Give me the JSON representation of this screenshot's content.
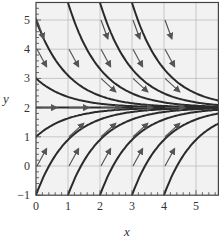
{
  "chart_data": {
    "type": "line",
    "title": "",
    "subtitle": "Slope field with solution curves converging to y = 2",
    "xlabel": "x",
    "ylabel": "y",
    "xlim": [
      0,
      5.7
    ],
    "ylim": [
      -1,
      5.6
    ],
    "x_ticks": [
      "0",
      "1",
      "2",
      "3",
      "4",
      "5"
    ],
    "y_ticks": [
      "-1",
      "0",
      "1",
      "2",
      "3",
      "4",
      "5"
    ],
    "grid": true,
    "legend": "none",
    "equilibrium": 2,
    "series": [
      {
        "name": "curve from (0,5)",
        "x0": 0,
        "y0": 5
      },
      {
        "name": "curve from (0,3)",
        "x0": 0,
        "y0": 3
      },
      {
        "name": "curve from (0,1)",
        "x0": 0,
        "y0": 1
      },
      {
        "name": "curve from (0,-1)",
        "x0": 0,
        "y0": -1
      },
      {
        "name": "curve from (1,-1)",
        "x0": 1,
        "y0": -1
      },
      {
        "name": "curve from (2,-1)",
        "x0": 2,
        "y0": -1
      },
      {
        "name": "curve from (3,-1)",
        "x0": 3,
        "y0": -1
      },
      {
        "name": "curve from (4,-1)",
        "x0": 4,
        "y0": -1
      },
      {
        "name": "curve from (1,5.6)",
        "x0": 1,
        "y0": 5.6
      },
      {
        "name": "curve from (2,5.6)",
        "x0": 2,
        "y0": 5.6
      },
      {
        "name": "curve from (3,5.6)",
        "x0": 3,
        "y0": 5.6
      },
      {
        "name": "curve y=2",
        "x0": 0,
        "y0": 2
      }
    ],
    "arrow_points": [
      [
        0,
        5
      ],
      [
        0,
        4
      ],
      [
        0,
        2
      ],
      [
        0,
        0
      ],
      [
        1,
        4
      ],
      [
        1,
        2
      ],
      [
        1,
        1
      ],
      [
        1,
        0
      ],
      [
        2,
        5
      ],
      [
        2,
        4
      ],
      [
        2,
        3
      ],
      [
        2,
        2
      ],
      [
        2,
        1
      ],
      [
        2,
        0
      ],
      [
        3,
        5
      ],
      [
        3,
        4
      ],
      [
        3,
        3
      ],
      [
        3,
        2
      ],
      [
        3,
        1
      ],
      [
        3,
        0
      ],
      [
        4,
        5
      ],
      [
        4,
        4
      ],
      [
        4,
        3
      ],
      [
        4,
        2
      ],
      [
        4,
        1
      ],
      [
        4,
        0
      ]
    ]
  },
  "colors": {
    "curve": "#2a2a2a",
    "grid": "#bdbdbd",
    "background": "#f2f2f2",
    "arrow": "#555555"
  }
}
